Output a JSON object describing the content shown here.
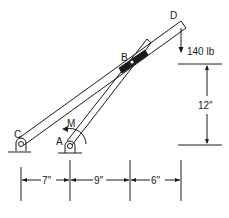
{
  "labels": {
    "point_a": "A",
    "point_b": "B",
    "point_c": "C",
    "point_d": "D",
    "moment": "M"
  },
  "load": {
    "value": "140 lb"
  },
  "dimensions": {
    "vertical": "12″",
    "horizontal": [
      "7″",
      "9″",
      "6″"
    ]
  },
  "colors": {
    "ink": "#1a1a1a",
    "background": "#ffffff"
  }
}
